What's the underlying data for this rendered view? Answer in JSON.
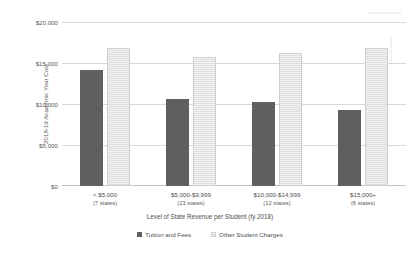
{
  "chart_data": {
    "type": "bar",
    "title": "",
    "xlabel": "Level of State Revenue per Student (fy 2018)",
    "ylabel": "2018-19 Academic Year Cost",
    "ylim": [
      0,
      20000
    ],
    "grid": true,
    "legend_position": "bottom",
    "categories": [
      "< $5,000",
      "$5,000-$9,999",
      "$10,000-$14,999",
      "$15,000+"
    ],
    "category_sublabels": [
      "(7 states)",
      "(23 states)",
      "(12 states)",
      "(6 states)"
    ],
    "ytick_labels": [
      "$0",
      "$5,000",
      "$10,000",
      "$15,000",
      "$20,000"
    ],
    "ytick_values": [
      0,
      5000,
      10000,
      15000,
      20000
    ],
    "series": [
      {
        "name": "Tuition and Fees",
        "color": "#5f5f5f",
        "values": [
          14100,
          10600,
          10200,
          9300
        ]
      },
      {
        "name": "Other Student Charges",
        "color": "#eaeaea",
        "values": [
          16800,
          15700,
          16200,
          16800
        ]
      }
    ]
  }
}
